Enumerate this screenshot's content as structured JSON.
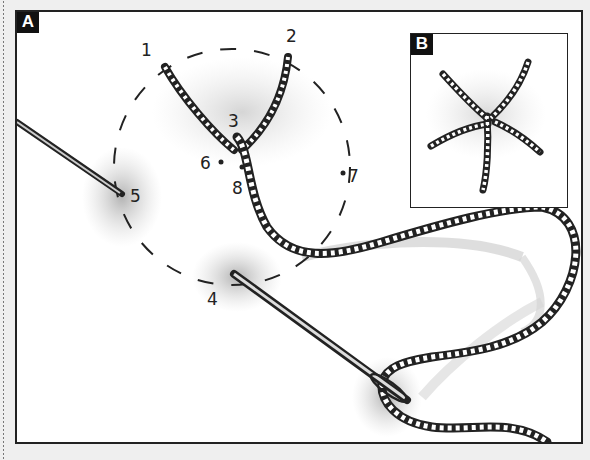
{
  "figure": {
    "panels": [
      {
        "id": "A",
        "label": "A",
        "description": "Working a star stitch: needle and thread around a dashed circle"
      },
      {
        "id": "B",
        "label": "B",
        "description": "Finished star stitch"
      }
    ],
    "points": [
      {
        "label": "1",
        "x": 146,
        "y": 46
      },
      {
        "label": "2",
        "x": 290,
        "y": 32
      },
      {
        "label": "3",
        "x": 232,
        "y": 122
      },
      {
        "label": "4",
        "x": 212,
        "y": 300
      },
      {
        "label": "5",
        "x": 132,
        "y": 198
      },
      {
        "label": "6",
        "x": 203,
        "y": 163
      },
      {
        "label": "7",
        "x": 352,
        "y": 178
      },
      {
        "label": "8",
        "x": 237,
        "y": 188
      }
    ],
    "colors": {
      "frame": "#222222",
      "thread": "#333333",
      "shading": "#bdbdbd",
      "badge_bg": "#111111",
      "badge_text": "#ffffff"
    }
  }
}
